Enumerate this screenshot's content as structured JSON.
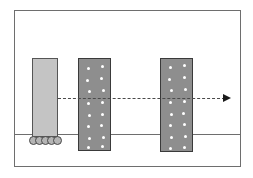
{
  "figure": {
    "canvas": {
      "width": 253,
      "height": 178,
      "background": "#ffffff"
    },
    "frame": {
      "name": "diagram-border",
      "x": 14,
      "y": 10,
      "width": 227,
      "height": 157,
      "stroke": "#6e6e6e",
      "stroke_width": 1
    },
    "ground_line": {
      "name": "ground-line",
      "x": 15,
      "y": 134,
      "width": 225,
      "stroke": "#6e6e6e"
    },
    "blocks": [
      {
        "id": "block-cart",
        "label": "light block on rollers",
        "x": 32,
        "y": 58,
        "width": 26,
        "height": 79,
        "fill": "#c4c4c4",
        "stroke": "#555555",
        "speckled": false
      },
      {
        "id": "block-target-1",
        "label": "first speckled target block",
        "x": 78,
        "y": 58,
        "width": 33,
        "height": 93,
        "fill": "#8e8e8e",
        "stroke": "#3a3a3a",
        "speckled": true,
        "speck_color": "#ffffff",
        "specks": [
          [
            8,
            8
          ],
          [
            22,
            6
          ],
          [
            7,
            20
          ],
          [
            21,
            18
          ],
          [
            9,
            31
          ],
          [
            23,
            30
          ],
          [
            8,
            43
          ],
          [
            22,
            42
          ],
          [
            9,
            55
          ],
          [
            22,
            54
          ],
          [
            8,
            66
          ],
          [
            21,
            65
          ],
          [
            9,
            78
          ],
          [
            23,
            77
          ],
          [
            8,
            87
          ],
          [
            22,
            86
          ]
        ]
      },
      {
        "id": "block-target-2",
        "label": "second speckled target block",
        "x": 160,
        "y": 58,
        "width": 33,
        "height": 94,
        "fill": "#8e8e8e",
        "stroke": "#3a3a3a",
        "speckled": true,
        "speck_color": "#ffffff",
        "specks": [
          [
            8,
            7
          ],
          [
            22,
            5
          ],
          [
            7,
            19
          ],
          [
            22,
            17
          ],
          [
            9,
            30
          ],
          [
            23,
            29
          ],
          [
            8,
            42
          ],
          [
            22,
            41
          ],
          [
            9,
            54
          ],
          [
            21,
            53
          ],
          [
            8,
            65
          ],
          [
            22,
            64
          ],
          [
            9,
            77
          ],
          [
            23,
            76
          ],
          [
            8,
            88
          ],
          [
            22,
            87
          ]
        ]
      }
    ],
    "rollers": {
      "name": "roller-wheels",
      "count": 5,
      "x": 29,
      "y": 136,
      "diameter": 9,
      "spacing": 6,
      "fill": "#b5b5b5",
      "stroke": "#4a4a4a"
    },
    "arrow": {
      "name": "trajectory-arrow",
      "style": "dashed",
      "x_start": 58,
      "x_end": 225,
      "y": 98,
      "color": "#4a4a4a",
      "head_color": "#1a1a1a",
      "direction": "right"
    }
  }
}
